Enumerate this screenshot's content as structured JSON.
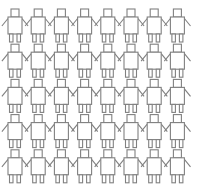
{
  "figure": {
    "background_color": "#ffffff"
  },
  "chart_data": {
    "type": "pictogram",
    "rows": 5,
    "columns": 8,
    "total_figures": 40,
    "highlighted_count": 5,
    "unhighlighted_count": 35,
    "categories": [
      "outline",
      "dark-gray",
      "black",
      "medium-gray"
    ],
    "legend": [
      {
        "label": "outline",
        "color": "#ffffff",
        "stroke": "#808080",
        "count": 35
      },
      {
        "label": "dark-gray",
        "color": "#4a4a4a",
        "stroke": "#3a3a3a",
        "count": 3
      },
      {
        "label": "medium-gray",
        "color": "#5a5a5a",
        "stroke": "#4a4a4a",
        "count": 1
      },
      {
        "label": "black",
        "color": "#0a0a0a",
        "stroke": "#000000",
        "count": 1
      }
    ],
    "highlights": [
      {
        "row": 2,
        "column": 6,
        "fill": "#4a4a4a",
        "stroke": "#3a3a3a"
      },
      {
        "row": 3,
        "column": 3,
        "fill": "#4a4a4a",
        "stroke": "#3a3a3a"
      },
      {
        "row": 4,
        "column": 5,
        "fill": "#0a0a0a",
        "stroke": "#000000"
      },
      {
        "row": 4,
        "column": 7,
        "fill": "#5a5a5a",
        "stroke": "#4a4a4a"
      },
      {
        "row": 5,
        "column": 1,
        "fill": "#4a4a4a",
        "stroke": "#3a3a3a"
      }
    ],
    "grid": [
      [
        "outline",
        "outline",
        "outline",
        "outline",
        "outline",
        "outline",
        "outline",
        "outline"
      ],
      [
        "outline",
        "outline",
        "outline",
        "outline",
        "outline",
        "dark-gray",
        "outline",
        "outline"
      ],
      [
        "outline",
        "outline",
        "dark-gray",
        "outline",
        "outline",
        "outline",
        "outline",
        "outline"
      ],
      [
        "outline",
        "outline",
        "outline",
        "outline",
        "black",
        "outline",
        "medium-gray",
        "outline"
      ],
      [
        "dark-gray",
        "outline",
        "outline",
        "outline",
        "outline",
        "outline",
        "outline",
        "outline"
      ]
    ],
    "colors": {
      "outline_fill": "#ffffff",
      "outline_stroke": "#808080",
      "dark_gray_fill": "#4a4a4a",
      "dark_gray_stroke": "#3a3a3a",
      "medium_gray_fill": "#5a5a5a",
      "medium_gray_stroke": "#4a4a4a",
      "black_fill": "#0a0a0a",
      "black_stroke": "#000000",
      "background": "#ffffff"
    },
    "geometry": {
      "origin_x": 8,
      "origin_y": 9,
      "cell_width": 23.2,
      "cell_height": 35.2,
      "head_width": 8,
      "head_height": 8,
      "body_width": 14,
      "body_height": 17,
      "leg_width": 3.5,
      "leg_height": 8,
      "leg_gap": 4
    },
    "xlabel": "",
    "ylabel": "",
    "grid_visible": false,
    "legend_position": "none"
  }
}
